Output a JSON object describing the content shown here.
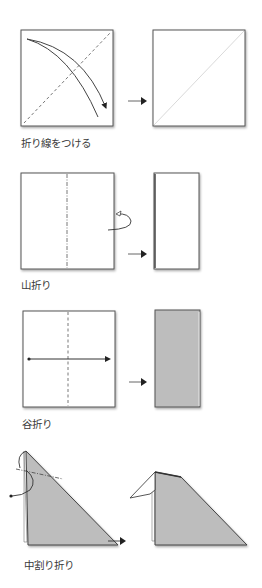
{
  "colors": {
    "paper": "#ffffff",
    "paper_back": "#bdbdbd",
    "outline": "#555555",
    "shadow": "#9a9a9a",
    "text": "#3a3a3a",
    "arrow": "#222222"
  },
  "steps": [
    {
      "id": "crease",
      "label": "折り線をつける",
      "before_icon": "square-with-diagonal-dashed-crease-and-fold-arrow",
      "after_icon": "square-with-light-diagonal-crease"
    },
    {
      "id": "mountain-fold",
      "label": "山折り",
      "before_icon": "square-with-dash-dot-vertical-line-and-back-fold-arrow",
      "after_icon": "folded-rectangle-white"
    },
    {
      "id": "valley-fold",
      "label": "谷折り",
      "before_icon": "square-with-dashed-vertical-line-and-horizontal-arrow",
      "after_icon": "folded-rectangle-gray"
    },
    {
      "id": "inside-reverse-fold",
      "label": "中割り折り",
      "before_icon": "triangle-with-dash-dot-line-and-reverse-arrows",
      "after_icon": "triangle-with-head-folded-inside"
    }
  ],
  "step_arrow_icon": "right-arrow"
}
